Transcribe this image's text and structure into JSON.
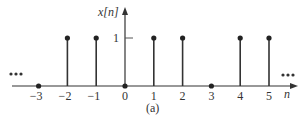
{
  "figure": {
    "caption": "(a)",
    "y_axis_label": "x[n]",
    "x_axis_label": "n",
    "y_tick_label": "1",
    "ellipsis_left": "•••",
    "ellipsis_right": "•••",
    "colors": {
      "ink": "#333333",
      "background": "#ffffff"
    }
  },
  "chart_data": {
    "type": "stem",
    "title": "",
    "caption": "(a)",
    "xlabel": "n",
    "ylabel": "x[n]",
    "x": [
      -3,
      -2,
      -1,
      0,
      1,
      2,
      3,
      4,
      5
    ],
    "values": [
      0,
      1,
      1,
      0,
      1,
      1,
      0,
      1,
      1
    ],
    "x_tick_labels": [
      "−3",
      "−2",
      "−1",
      "0",
      "1",
      "2",
      "3",
      "4",
      "5"
    ],
    "y_ticks": [
      1
    ],
    "periodic_continuation": "ellipsis on both sides (sequence continues)",
    "grid": false
  }
}
